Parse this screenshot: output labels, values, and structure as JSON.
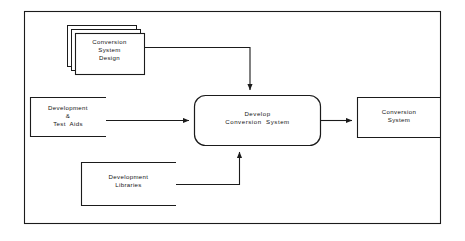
{
  "diagram": {
    "type": "data-flow-diagram",
    "colors": {
      "background": "#ffffff",
      "stroke": "#1b1b1b",
      "text": "#141414"
    },
    "frame": {
      "name": "outer-border",
      "x": 24,
      "y": 11,
      "width": 417,
      "height": 213
    },
    "nodes": [
      {
        "id": "conversion-system-design",
        "kind": "stacked-document",
        "lines": [
          "Conversion",
          "System",
          "Design"
        ],
        "text": "Conversion System Design",
        "x": 67,
        "y": 25,
        "width": 70,
        "height": 42,
        "stack_layers": 3,
        "stack_offset": 4
      },
      {
        "id": "development-and-test-aids",
        "kind": "open-ended-store",
        "lines": [
          "Development",
          "&",
          "Test  Aids"
        ],
        "text": "Development & Test Aids",
        "x": 30,
        "y": 97,
        "width": 76,
        "height": 40
      },
      {
        "id": "develop-conversion-system",
        "kind": "process",
        "lines": [
          "Develop",
          "Conversion  System"
        ],
        "text": "Develop Conversion System",
        "x": 194,
        "y": 95,
        "width": 127,
        "height": 51,
        "corner_radius": 11
      },
      {
        "id": "development-libraries",
        "kind": "open-ended-store",
        "lines": [
          "Development",
          "Libraries"
        ],
        "text": "Development Libraries",
        "x": 81,
        "y": 162,
        "width": 95,
        "height": 44
      },
      {
        "id": "conversion-system",
        "kind": "open-ended-store",
        "lines": [
          "Conversion",
          "System"
        ],
        "text": "Conversion System",
        "x": 357,
        "y": 97,
        "width": 84,
        "height": 41
      }
    ],
    "flows": [
      {
        "id": "flow-design-to-process",
        "from": "conversion-system-design",
        "to": "develop-conversion-system",
        "label": "",
        "arrow": "down-into-top"
      },
      {
        "id": "flow-aids-to-process",
        "from": "development-and-test-aids",
        "to": "develop-conversion-system",
        "label": "",
        "arrow": "right-into-left"
      },
      {
        "id": "flow-libraries-to-process",
        "from": "development-libraries",
        "to": "develop-conversion-system",
        "label": "",
        "arrow": "up-into-bottom"
      },
      {
        "id": "flow-process-to-output",
        "from": "develop-conversion-system",
        "to": "conversion-system",
        "label": "",
        "arrow": "right-into-left"
      }
    ]
  }
}
